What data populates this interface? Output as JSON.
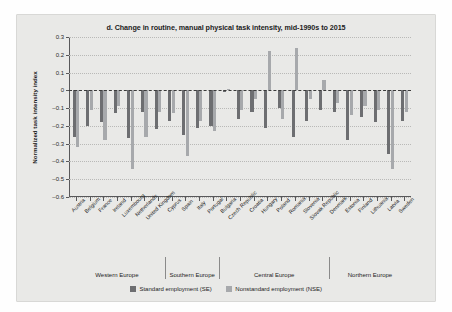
{
  "chart_data": {
    "type": "bar",
    "title": "d. Change in routine, manual physical task intensity, mid-1990s to 2015",
    "xlabel": "",
    "ylabel": "Normalized task intensity index",
    "ylim": [
      -0.6,
      0.3
    ],
    "yticks": [
      0.3,
      0.2,
      0.1,
      0,
      -0.1,
      -0.2,
      -0.3,
      -0.4,
      -0.5,
      -0.6
    ],
    "ytick_labels": [
      "0.3",
      "0.2",
      "0.1",
      "0",
      "–0.1",
      "–0.2",
      "–0.3",
      "–0.4",
      "–0.5",
      "–0.6"
    ],
    "grid": true,
    "legend_position": "bottom",
    "categories": [
      "Austria",
      "Belgium",
      "France",
      "Ireland",
      "Luxembourg",
      "Netherlands",
      "United Kingdom",
      "Cyprus",
      "Spain",
      "Italy",
      "Portugal",
      "Bulgaria",
      "Czech Republic",
      "Croatia",
      "Hungary",
      "Poland",
      "Romania",
      "Slovenia",
      "Slovak Republic",
      "Denmark",
      "Estonia",
      "Finland",
      "Lithuania",
      "Latvia",
      "Sweden"
    ],
    "series": [
      {
        "name": "Standard employment (SE)",
        "color": "#6d6e71",
        "values": [
          -0.26,
          -0.2,
          -0.18,
          -0.13,
          -0.27,
          -0.12,
          -0.22,
          -0.17,
          -0.25,
          -0.21,
          -0.2,
          -0.01,
          -0.16,
          -0.12,
          -0.21,
          -0.1,
          -0.26,
          -0.17,
          -0.11,
          -0.12,
          -0.28,
          -0.15,
          -0.18,
          -0.36,
          -0.17
        ]
      },
      {
        "name": "Nonstandard employment (NSE)",
        "color": "#a7a9ac",
        "values": [
          -0.32,
          -0.11,
          -0.28,
          -0.09,
          -0.44,
          -0.26,
          -0.12,
          -0.13,
          -0.37,
          -0.17,
          -0.23,
          0.01,
          -0.11,
          -0.05,
          0.22,
          -0.16,
          0.24,
          -0.05,
          0.06,
          -0.07,
          -0.14,
          -0.09,
          -0.11,
          -0.44,
          -0.12
        ]
      }
    ],
    "groups": [
      {
        "label": "Western Europe",
        "count": 7
      },
      {
        "label": "Southern Europe",
        "count": 4
      },
      {
        "label": "Central Europe",
        "count": 8
      },
      {
        "label": "Northern Europe",
        "count": 6
      }
    ]
  },
  "legend": {
    "items": [
      {
        "label": "Standard employment (SE)"
      },
      {
        "label": "Nonstandard employment (NSE)"
      }
    ]
  }
}
